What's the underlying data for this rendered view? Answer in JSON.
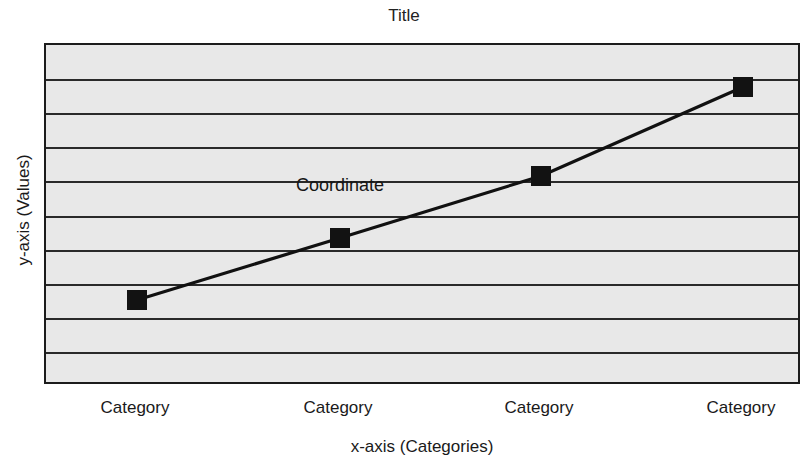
{
  "chart_data": {
    "type": "line",
    "title": "Title",
    "xlabel": "x-axis (Categories)",
    "ylabel": "y-axis (Values)",
    "categories": [
      "Category",
      "Category",
      "Category",
      "Category"
    ],
    "series": [
      {
        "name": "Coordinate",
        "values": [
          2.5,
          4.3,
          6.1,
          8.7
        ]
      }
    ],
    "ylim": [
      0,
      10
    ],
    "grid": true,
    "gridline_count": 9,
    "legend": "inline-series-label",
    "annotations": [
      {
        "text": "Coordinate",
        "x_frac": 0.389,
        "y_frac": 0.41
      }
    ],
    "marker": {
      "shape": "square",
      "size_px": 20,
      "color": "#121212"
    },
    "colors": {
      "plot_background": "#e8e8e8",
      "page_background": "#ffffff",
      "line": "#111111",
      "gridline": "#2a2a2a",
      "border": "#1c1c1c",
      "text": "#1a1a1a"
    },
    "points_px": [
      {
        "x": 91,
        "y": 255
      },
      {
        "x": 294,
        "y": 193
      },
      {
        "x": 495,
        "y": 131
      },
      {
        "x": 697,
        "y": 42
      }
    ],
    "tick_positions_px": [
      91,
      294,
      495,
      697
    ]
  }
}
